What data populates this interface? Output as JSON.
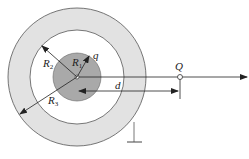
{
  "diagram": {
    "type": "concentric conducting sphere and grounded spherical shell with external point charge",
    "labels": {
      "R1": "R",
      "R1_sub": "1",
      "R2": "R",
      "R2_sub": "2",
      "R3": "R",
      "R3_sub": "3",
      "q": "q",
      "Q": "Q",
      "d": "d"
    },
    "colors": {
      "inner_sphere": "#a9a9a9",
      "shell": "#e2e2e2",
      "stroke": "#333333",
      "background": "#ffffff"
    }
  }
}
